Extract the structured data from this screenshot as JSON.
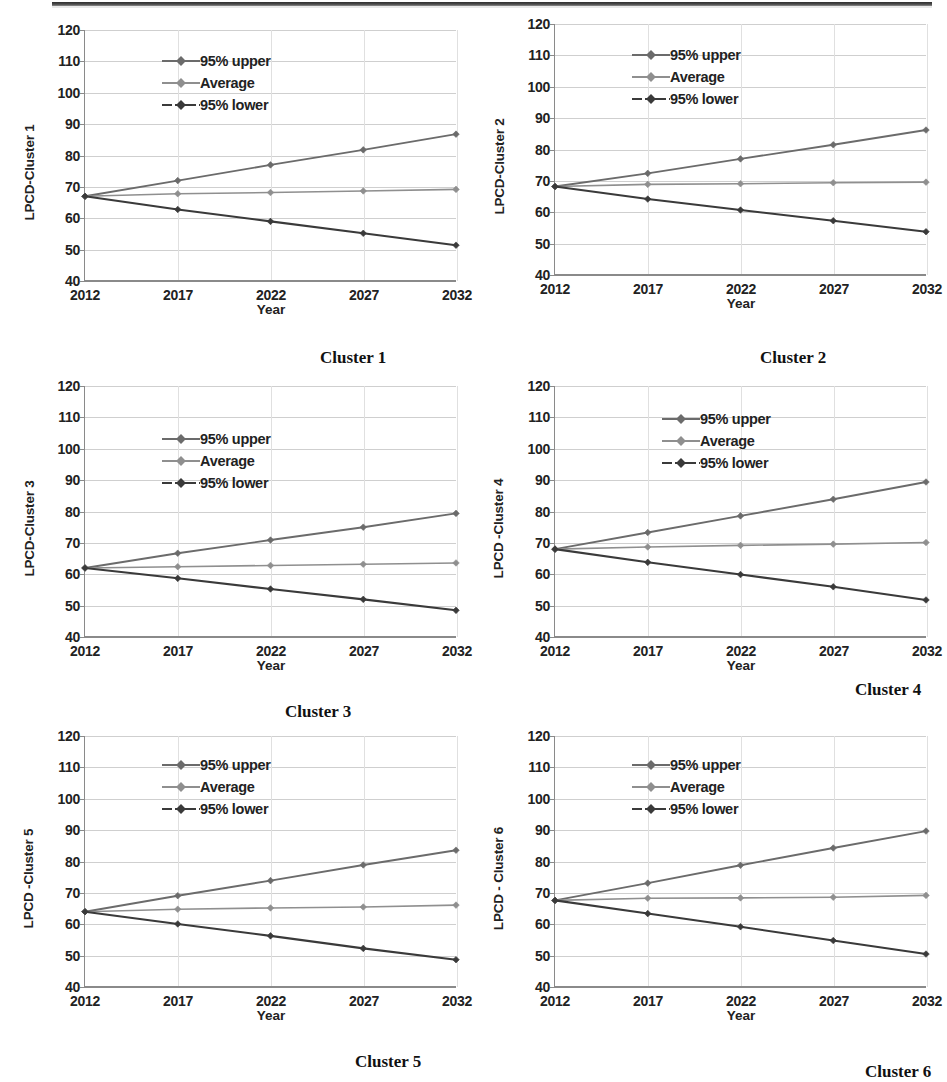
{
  "page": {
    "axis": {
      "y_ticks": [
        120,
        110,
        100,
        90,
        80,
        70,
        60,
        50,
        40
      ],
      "y_min": 40,
      "y_max": 120,
      "x_ticks": [
        "2012",
        "2017",
        "2022",
        "2027",
        "2032"
      ],
      "x_label": "Year"
    },
    "legend_labels": {
      "upper": "95% upper",
      "average": "Average",
      "lower": "95% lower"
    },
    "colors": {
      "upper": "#6b6b6b",
      "average": "#8f8f8f",
      "lower": "#3a3a3a",
      "grid": "#cfcfcf",
      "axis": "#8a8a8a",
      "text": "#222222"
    }
  },
  "charts": [
    {
      "id": "cluster-1",
      "caption": "Cluster 1",
      "ylabel": "LPCD-Cluster 1",
      "chart_data": {
        "type": "line",
        "title": "Cluster 1",
        "xlabel": "Year",
        "ylabel": "LPCD-Cluster 1",
        "x": [
          "2012",
          "2017",
          "2022",
          "2027",
          "2032"
        ],
        "ylim": [
          40,
          120
        ],
        "grid": true,
        "legend_position": "top-left",
        "series": [
          {
            "name": "95% upper",
            "values": [
              67.0,
              72.0,
              77.0,
              81.8,
              86.8
            ]
          },
          {
            "name": "Average",
            "values": [
              67.0,
              67.8,
              68.2,
              68.7,
              69.2
            ]
          },
          {
            "name": "95% lower",
            "values": [
              67.0,
              62.8,
              59.0,
              55.2,
              51.4
            ]
          }
        ]
      }
    },
    {
      "id": "cluster-2",
      "caption": "Cluster 2",
      "ylabel": "LPCD-Cluster 2",
      "chart_data": {
        "type": "line",
        "title": "Cluster 2",
        "xlabel": "Year",
        "ylabel": "LPCD-Cluster 2",
        "x": [
          "2012",
          "2017",
          "2022",
          "2027",
          "2032"
        ],
        "ylim": [
          40,
          120
        ],
        "grid": true,
        "legend_position": "top-left",
        "series": [
          {
            "name": "95% upper",
            "values": [
              68.2,
              72.4,
              77.0,
              81.5,
              86.2
            ]
          },
          {
            "name": "Average",
            "values": [
              68.2,
              68.9,
              69.1,
              69.4,
              69.6
            ]
          },
          {
            "name": "95% lower",
            "values": [
              68.2,
              64.2,
              60.7,
              57.3,
              53.8
            ]
          }
        ]
      }
    },
    {
      "id": "cluster-3",
      "caption": "Cluster 3",
      "ylabel": "LPCD-Cluster 3",
      "chart_data": {
        "type": "line",
        "title": "Cluster 3",
        "xlabel": "Year",
        "ylabel": "LPCD-Cluster 3",
        "x": [
          "2012",
          "2017",
          "2022",
          "2027",
          "2032"
        ],
        "ylim": [
          40,
          120
        ],
        "grid": true,
        "legend_position": "top-left",
        "series": [
          {
            "name": "95% upper",
            "values": [
              62.0,
              66.7,
              70.9,
              75.0,
              79.4
            ]
          },
          {
            "name": "Average",
            "values": [
              62.0,
              62.4,
              62.8,
              63.2,
              63.6
            ]
          },
          {
            "name": "95% lower",
            "values": [
              62.0,
              58.7,
              55.3,
              52.0,
              48.5
            ]
          }
        ]
      }
    },
    {
      "id": "cluster-4",
      "caption": "Cluster 4",
      "ylabel": "LPCD -Cluster 4",
      "chart_data": {
        "type": "line",
        "title": "Cluster 4",
        "xlabel": "Year",
        "ylabel": "LPCD -Cluster 4",
        "x": [
          "2012",
          "2017",
          "2022",
          "2027",
          "2032"
        ],
        "ylim": [
          40,
          120
        ],
        "grid": true,
        "legend_position": "top-left",
        "series": [
          {
            "name": "95% upper",
            "values": [
              68.0,
              73.3,
              78.6,
              83.9,
              89.4
            ]
          },
          {
            "name": "Average",
            "values": [
              68.0,
              68.7,
              69.2,
              69.6,
              70.1
            ]
          },
          {
            "name": "95% lower",
            "values": [
              68.0,
              63.8,
              59.9,
              56.0,
              51.8
            ]
          }
        ]
      }
    },
    {
      "id": "cluster-5",
      "caption": "Cluster 5",
      "ylabel": "LPCD -Cluster 5",
      "chart_data": {
        "type": "line",
        "title": "Cluster 5",
        "xlabel": "Year",
        "ylabel": "LPCD -Cluster 5",
        "x": [
          "2012",
          "2017",
          "2022",
          "2027",
          "2032"
        ],
        "ylim": [
          40,
          120
        ],
        "grid": true,
        "legend_position": "top-left",
        "series": [
          {
            "name": "95% upper",
            "values": [
              64.0,
              69.1,
              73.9,
              78.9,
              83.6
            ]
          },
          {
            "name": "Average",
            "values": [
              64.0,
              64.8,
              65.2,
              65.5,
              66.1
            ]
          },
          {
            "name": "95% lower",
            "values": [
              64.0,
              60.1,
              56.3,
              52.3,
              48.7
            ]
          }
        ]
      }
    },
    {
      "id": "cluster-6",
      "caption": "Cluster 6",
      "ylabel": "LPCD - Cluster 6",
      "chart_data": {
        "type": "line",
        "title": "Cluster 6",
        "xlabel": "Year",
        "ylabel": "LPCD - Cluster 6",
        "x": [
          "2012",
          "2017",
          "2022",
          "2027",
          "2032"
        ],
        "ylim": [
          40,
          120
        ],
        "grid": true,
        "legend_position": "top-left",
        "series": [
          {
            "name": "95% upper",
            "values": [
              67.6,
              73.1,
              78.8,
              84.3,
              89.7
            ]
          },
          {
            "name": "Average",
            "values": [
              67.6,
              68.3,
              68.4,
              68.6,
              69.2
            ]
          },
          {
            "name": "95% lower",
            "values": [
              67.6,
              63.4,
              59.2,
              54.8,
              50.5
            ]
          }
        ]
      }
    }
  ],
  "layout": {
    "charts": [
      {
        "left": 18,
        "top": 30,
        "width": 440,
        "height": 285,
        "legend_left": 120,
        "legend_top": 20
      },
      {
        "left": 488,
        "top": 24,
        "width": 440,
        "height": 285,
        "legend_left": 120,
        "legend_top": 20
      },
      {
        "left": 18,
        "top": 386,
        "width": 440,
        "height": 285,
        "legend_left": 120,
        "legend_top": 42
      },
      {
        "left": 488,
        "top": 386,
        "width": 440,
        "height": 285,
        "legend_left": 150,
        "legend_top": 22
      },
      {
        "left": 18,
        "top": 736,
        "width": 440,
        "height": 285,
        "legend_left": 120,
        "legend_top": 18
      },
      {
        "left": 488,
        "top": 736,
        "width": 440,
        "height": 285,
        "legend_left": 120,
        "legend_top": 18
      }
    ],
    "captions": [
      {
        "left": 320,
        "top": 348
      },
      {
        "left": 760,
        "top": 348
      },
      {
        "left": 285,
        "top": 702
      },
      {
        "left": 855,
        "top": 680
      },
      {
        "left": 355,
        "top": 1052
      },
      {
        "left": 865,
        "top": 1062
      }
    ]
  }
}
